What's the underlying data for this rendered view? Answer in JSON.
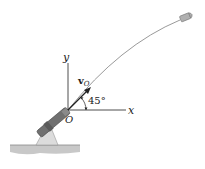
{
  "figure": {
    "axes": {
      "x_label": "x",
      "y_label": "y",
      "origin_label": "O"
    },
    "velocity": {
      "symbol": "v",
      "subscript": "O",
      "angle_label": "45°",
      "angle_deg": 45
    },
    "colors": {
      "ink": "#222222",
      "trajectory": "#9a9a9a",
      "ground": "#c8c8c8",
      "cannon_body": "#6e6e6e",
      "cannon_base": "#d9d9d9",
      "projectile": "#a8a8a8"
    }
  }
}
